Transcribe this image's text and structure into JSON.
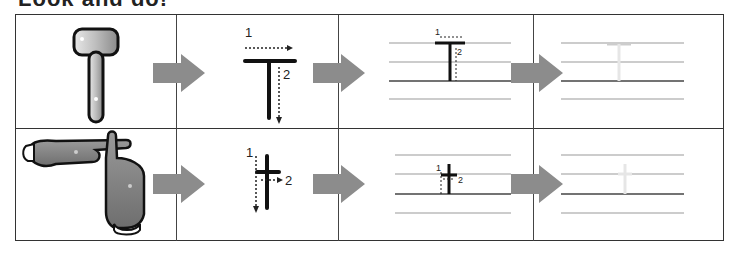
{
  "title": "Look and do!",
  "colors": {
    "border": "#333333",
    "arrow": "#8c8c8c",
    "stroke": "#111111",
    "guide_line": "#999999",
    "baseline": "#444444",
    "trace_ghost": "#e6e6e6"
  },
  "rows": [
    {
      "letter": "T",
      "picture": {
        "icon": "hammer-icon",
        "description": "mallet shaped like letter T"
      },
      "stroke_order": [
        {
          "number": "1",
          "direction": "left-to-right"
        },
        {
          "number": "2",
          "direction": "top-to-bottom"
        }
      ],
      "practice_labels": [
        "1",
        "2"
      ]
    },
    {
      "letter": "t",
      "picture": {
        "icon": "hands-t-sign-icon",
        "description": "two hands forming letter t"
      },
      "stroke_order": [
        {
          "number": "1",
          "direction": "top-to-bottom"
        },
        {
          "number": "2",
          "direction": "left-to-right"
        }
      ],
      "practice_labels": [
        "1",
        "2"
      ]
    }
  ]
}
